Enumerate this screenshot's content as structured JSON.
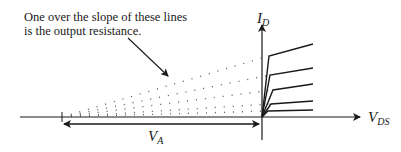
{
  "annotation": {
    "line1": "One over the slope of these lines",
    "line2": "is the output resistance."
  },
  "axes": {
    "y_label_main": "I",
    "y_label_sub": "D",
    "x_label_main": "V",
    "x_label_sub": "DS",
    "intercept_label_main": "V",
    "intercept_label_sub": "A"
  },
  "colors": {
    "line": "#1a1a1a",
    "dots": "#555555",
    "background": "#ffffff"
  },
  "geometry": {
    "origin": [
      262,
      117
    ],
    "va_point": [
      62,
      117
    ],
    "curves": [
      {
        "knee": [
          269,
          56
        ],
        "end": [
          313,
          44
        ]
      },
      {
        "knee": [
          270,
          75
        ],
        "end": [
          313,
          68
        ]
      },
      {
        "knee": [
          273,
          90
        ],
        "end": [
          313,
          84
        ]
      },
      {
        "knee": [
          271,
          104
        ],
        "end": [
          313,
          101
        ]
      },
      {
        "knee": [
          268,
          111
        ],
        "end": [
          313,
          110
        ]
      }
    ]
  }
}
